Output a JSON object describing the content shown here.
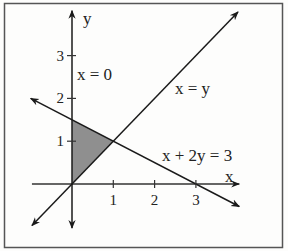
{
  "figure": {
    "axes": {
      "x_label": "x",
      "y_label": "y",
      "x_ticks": [
        "1",
        "2",
        "3"
      ],
      "y_ticks": [
        "1",
        "2",
        "3"
      ],
      "x_tick_values": [
        1,
        2,
        3
      ],
      "y_tick_values": [
        1,
        2,
        3
      ],
      "x_range": [
        -1,
        4
      ],
      "y_range": [
        -1,
        4
      ]
    },
    "lines": [
      {
        "id": "x-eq-0",
        "label": "x = 0",
        "equation": "x = 0"
      },
      {
        "id": "x-eq-y",
        "label": "x = y",
        "equation": "y = x"
      },
      {
        "id": "x-plus-2y-eq-3",
        "label": "x + 2y = 3",
        "equation": "x + 2y = 3"
      }
    ],
    "shaded_region": {
      "vertices": [
        [
          0,
          0
        ],
        [
          0,
          1.5
        ],
        [
          1,
          1
        ]
      ],
      "fill_color": "#8f8f8f"
    },
    "colors": {
      "line": "#1a1a1a",
      "axis": "#333333",
      "frame": "#555555"
    }
  }
}
